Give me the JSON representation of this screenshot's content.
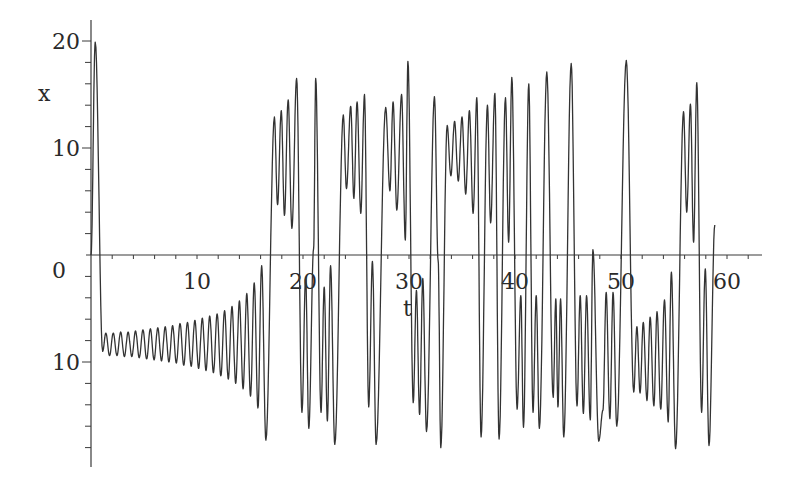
{
  "chart_data": {
    "type": "line",
    "title": "",
    "xlabel": "t",
    "ylabel": "x",
    "xlim": [
      0,
      63
    ],
    "ylim": [
      -19.5,
      22
    ],
    "grid": false,
    "legend": null,
    "x_ticks": [
      {
        "value": 10,
        "label": "10"
      },
      {
        "value": 20,
        "label": "20"
      },
      {
        "value": 30,
        "label": "30"
      },
      {
        "value": 40,
        "label": "40"
      },
      {
        "value": 50,
        "label": "50"
      },
      {
        "value": 60,
        "label": "60"
      }
    ],
    "y_ticks": [
      {
        "value": 20,
        "label": "20"
      },
      {
        "value": 10,
        "label": "10"
      },
      {
        "value": -10,
        "label": "10"
      }
    ],
    "origin_label": "0",
    "x_minor_step": 2,
    "y_minor_step": 2,
    "series": [
      {
        "name": "x(t)",
        "color": "#333333",
        "description": "Lorenz-type chaotic trajectory; extrema sequence (t, x)",
        "extrema": [
          [
            0.0,
            0.0
          ],
          [
            0.4,
            19.9
          ],
          [
            1.1,
            -9.0
          ],
          [
            1.4,
            -7.3
          ],
          [
            1.75,
            -9.4
          ],
          [
            2.1,
            -7.3
          ],
          [
            2.45,
            -9.4
          ],
          [
            2.8,
            -7.2
          ],
          [
            3.15,
            -9.5
          ],
          [
            3.5,
            -7.2
          ],
          [
            3.85,
            -9.5
          ],
          [
            4.2,
            -7.1
          ],
          [
            4.55,
            -9.6
          ],
          [
            4.9,
            -7.0
          ],
          [
            5.25,
            -9.7
          ],
          [
            5.6,
            -6.9
          ],
          [
            5.95,
            -9.8
          ],
          [
            6.3,
            -6.8
          ],
          [
            6.65,
            -9.9
          ],
          [
            7.0,
            -6.7
          ],
          [
            7.35,
            -10.0
          ],
          [
            7.7,
            -6.6
          ],
          [
            8.05,
            -10.1
          ],
          [
            8.4,
            -6.4
          ],
          [
            8.75,
            -10.3
          ],
          [
            9.1,
            -6.3
          ],
          [
            9.45,
            -10.4
          ],
          [
            9.8,
            -6.1
          ],
          [
            10.15,
            -10.6
          ],
          [
            10.5,
            -5.9
          ],
          [
            10.85,
            -10.8
          ],
          [
            11.2,
            -5.7
          ],
          [
            11.55,
            -11.0
          ],
          [
            11.9,
            -5.5
          ],
          [
            12.25,
            -11.3
          ],
          [
            12.6,
            -5.2
          ],
          [
            12.95,
            -11.6
          ],
          [
            13.3,
            -4.8
          ],
          [
            13.65,
            -12.0
          ],
          [
            14.0,
            -4.3
          ],
          [
            14.35,
            -12.5
          ],
          [
            14.7,
            -3.6
          ],
          [
            15.05,
            -13.2
          ],
          [
            15.4,
            -2.6
          ],
          [
            15.75,
            -14.3
          ],
          [
            16.1,
            -1.0
          ],
          [
            16.5,
            -17.3
          ],
          [
            17.3,
            12.9
          ],
          [
            17.6,
            4.7
          ],
          [
            17.95,
            13.5
          ],
          [
            18.25,
            3.7
          ],
          [
            18.6,
            14.5
          ],
          [
            18.95,
            2.5
          ],
          [
            19.4,
            16.5
          ],
          [
            19.9,
            -14.7
          ],
          [
            20.25,
            -2.1
          ],
          [
            20.55,
            -16.2
          ],
          [
            21.0,
            0.6
          ],
          [
            21.2,
            16.5
          ],
          [
            21.7,
            -14.7
          ],
          [
            22.0,
            -3.0
          ],
          [
            22.3,
            -15.5
          ],
          [
            22.6,
            -1.0
          ],
          [
            23.0,
            -17.7
          ],
          [
            23.8,
            13.1
          ],
          [
            24.1,
            6.2
          ],
          [
            24.5,
            13.9
          ],
          [
            24.8,
            5.3
          ],
          [
            25.1,
            14.3
          ],
          [
            25.45,
            3.9
          ],
          [
            25.8,
            15.0
          ],
          [
            26.2,
            -14.2
          ],
          [
            26.55,
            -0.6
          ],
          [
            26.9,
            -17.7
          ],
          [
            27.8,
            13.8
          ],
          [
            28.2,
            6.0
          ],
          [
            28.5,
            14.3
          ],
          [
            28.85,
            4.2
          ],
          [
            29.3,
            15.0
          ],
          [
            29.65,
            1.4
          ],
          [
            29.9,
            18.1
          ],
          [
            30.4,
            -13.8
          ],
          [
            30.7,
            -3.3
          ],
          [
            31.0,
            -14.9
          ],
          [
            31.3,
            -2.2
          ],
          [
            31.65,
            -16.5
          ],
          [
            32.4,
            14.8
          ],
          [
            32.75,
            -0.5
          ],
          [
            33.0,
            -18.0
          ],
          [
            33.6,
            12.1
          ],
          [
            33.95,
            7.4
          ],
          [
            34.3,
            12.5
          ],
          [
            34.65,
            6.9
          ],
          [
            35.0,
            12.9
          ],
          [
            35.35,
            5.7
          ],
          [
            35.7,
            13.5
          ],
          [
            36.05,
            3.9
          ],
          [
            36.4,
            14.7
          ],
          [
            36.8,
            -17.0
          ],
          [
            37.4,
            14.0
          ],
          [
            37.7,
            3.0
          ],
          [
            38.1,
            15.1
          ],
          [
            38.5,
            -17.2
          ],
          [
            39.1,
            14.7
          ],
          [
            39.4,
            1.2
          ],
          [
            39.7,
            16.6
          ],
          [
            40.2,
            -14.4
          ],
          [
            40.55,
            -3.8
          ],
          [
            40.8,
            -16.1
          ],
          [
            41.3,
            16.0
          ],
          [
            41.7,
            -14.7
          ],
          [
            42.0,
            -3.8
          ],
          [
            42.3,
            -16.2
          ],
          [
            43.0,
            17.1
          ],
          [
            43.6,
            -13.3
          ],
          [
            43.85,
            -4.1
          ],
          [
            44.05,
            -14.2
          ],
          [
            44.3,
            -4.1
          ],
          [
            44.6,
            -17.0
          ],
          [
            45.3,
            17.9
          ],
          [
            45.85,
            -14.1
          ],
          [
            46.15,
            -3.8
          ],
          [
            46.45,
            -14.8
          ],
          [
            46.75,
            -3.8
          ],
          [
            47.1,
            -15.4
          ],
          [
            47.35,
            0.5
          ],
          [
            47.9,
            -17.4
          ]
        ],
        "extrema_tail": [
          [
            48.3,
            -14.5
          ],
          [
            48.6,
            -3.5
          ],
          [
            48.95,
            -15.3
          ],
          [
            49.25,
            -3.5
          ],
          [
            49.6,
            -16.0
          ],
          [
            50.5,
            18.2
          ],
          [
            51.2,
            -12.8
          ],
          [
            51.5,
            -6.7
          ],
          [
            51.8,
            -12.9
          ],
          [
            52.1,
            -6.3
          ],
          [
            52.45,
            -13.6
          ],
          [
            52.75,
            -5.8
          ],
          [
            53.1,
            -14.1
          ],
          [
            53.4,
            -5.3
          ],
          [
            53.75,
            -14.4
          ],
          [
            54.1,
            -4.2
          ],
          [
            54.45,
            -15.6
          ],
          [
            54.75,
            -1.6
          ],
          [
            55.15,
            -18.1
          ],
          [
            55.9,
            13.4
          ],
          [
            56.2,
            4.0
          ],
          [
            56.55,
            14.1
          ],
          [
            56.85,
            1.2
          ],
          [
            57.15,
            16.1
          ],
          [
            57.6,
            -14.7
          ],
          [
            57.95,
            -1.3
          ],
          [
            58.3,
            -17.8
          ],
          [
            58.85,
            2.8
          ]
        ]
      }
    ]
  }
}
